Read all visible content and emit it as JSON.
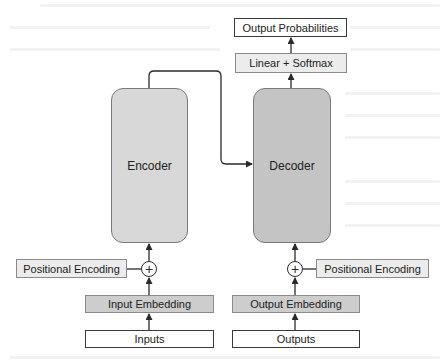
{
  "diagram": {
    "type": "transformer-architecture",
    "top": {
      "output_probabilities": "Output Probabilities",
      "linear_softmax": "Linear + Softmax"
    },
    "encoder": {
      "label": "Encoder",
      "positional_encoding": "Positional Encoding",
      "embedding": "Input Embedding",
      "input": "Inputs",
      "add_symbol": "+"
    },
    "decoder": {
      "label": "Decoder",
      "positional_encoding": "Positional Encoding",
      "embedding": "Output Embedding",
      "input": "Outputs",
      "add_symbol": "+"
    },
    "edges": [
      {
        "from": "Inputs",
        "to": "Input Embedding"
      },
      {
        "from": "Input Embedding",
        "to": "encoder-add"
      },
      {
        "from": "Positional Encoding (encoder)",
        "to": "encoder-add"
      },
      {
        "from": "encoder-add",
        "to": "Encoder"
      },
      {
        "from": "Encoder",
        "to": "Decoder"
      },
      {
        "from": "Outputs",
        "to": "Output Embedding"
      },
      {
        "from": "Output Embedding",
        "to": "decoder-add"
      },
      {
        "from": "Positional Encoding (decoder)",
        "to": "decoder-add"
      },
      {
        "from": "decoder-add",
        "to": "Decoder"
      },
      {
        "from": "Decoder",
        "to": "Linear + Softmax"
      },
      {
        "from": "Linear + Softmax",
        "to": "Output Probabilities"
      }
    ],
    "colors": {
      "encoder_fill": "#d8d8d8",
      "decoder_fill": "#c4c4c4",
      "embedding_fill": "#cdcdcd",
      "light_fill": "#ececec",
      "io_fill": "#ffffff",
      "stroke": "#2a2a2a"
    }
  }
}
